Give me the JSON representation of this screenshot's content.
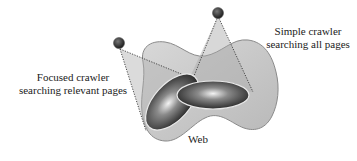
{
  "diagram": {
    "labels": {
      "focused_crawler": [
        "Focused crawler",
        "searching relevant pages"
      ],
      "simple_crawler": [
        "Simple crawler",
        "searching all pages"
      ],
      "web": "Web"
    },
    "nodes": [
      {
        "id": "focused-crawler",
        "shape": "dark-sphere",
        "role": "crawler"
      },
      {
        "id": "simple-crawler",
        "shape": "dark-sphere",
        "role": "crawler"
      },
      {
        "id": "web",
        "shape": "wavy-gray-surface"
      },
      {
        "id": "relevant-pages-region",
        "shape": "tilted-dark-ellipse"
      },
      {
        "id": "all-pages-region",
        "shape": "flat-dark-ellipse"
      }
    ],
    "edges": [
      {
        "from": "focused-crawler",
        "to": "relevant-pages-region",
        "style": "dotted-cone"
      },
      {
        "from": "simple-crawler",
        "to": "all-pages-region",
        "style": "dotted-cone"
      }
    ],
    "colors": {
      "web_fill": "#c9c9c9",
      "web_stroke": "#8a8a8a",
      "cone_fill": "#b5b5b5",
      "ellipse_dark": "#1e1e1e",
      "ellipse_highlight": "#f4f4f4",
      "crawler": "#2a2a2a"
    }
  }
}
